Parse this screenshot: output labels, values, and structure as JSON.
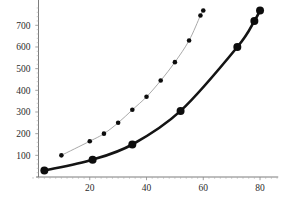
{
  "chart_data": {
    "type": "line",
    "title": "",
    "subtitle": "",
    "xlabel": "",
    "ylabel": "",
    "xlim": [
      0,
      85
    ],
    "ylim": [
      0,
      790
    ],
    "grid": false,
    "legend": "none",
    "x_ticks": [
      20,
      40,
      60,
      80
    ],
    "x_tick_labels": [
      "20",
      "40",
      "60",
      "80"
    ],
    "y_ticks": [
      100,
      200,
      300,
      400,
      500,
      600,
      700
    ],
    "y_tick_labels": [
      "100",
      "200",
      "300",
      "400",
      "500",
      "600",
      "700"
    ],
    "series": [
      {
        "name": "upper-curve",
        "style": "thin-line-small-markers",
        "color": "#9a9a9a",
        "marker_color": "#0d0d0d",
        "points": [
          {
            "x": 10,
            "y": 100
          },
          {
            "x": 20,
            "y": 165
          },
          {
            "x": 25,
            "y": 200
          },
          {
            "x": 30,
            "y": 250
          },
          {
            "x": 35,
            "y": 310
          },
          {
            "x": 40,
            "y": 370
          },
          {
            "x": 45,
            "y": 445
          },
          {
            "x": 50,
            "y": 530
          },
          {
            "x": 55,
            "y": 630
          },
          {
            "x": 59,
            "y": 745
          },
          {
            "x": 60,
            "y": 768
          }
        ]
      },
      {
        "name": "lower-curve",
        "style": "thick-line-large-markers",
        "color": "#141414",
        "marker_color": "#0d0d0d",
        "points": [
          {
            "x": 4,
            "y": 30
          },
          {
            "x": 21,
            "y": 80
          },
          {
            "x": 35,
            "y": 150
          },
          {
            "x": 52,
            "y": 305
          },
          {
            "x": 72,
            "y": 600
          },
          {
            "x": 78,
            "y": 720
          },
          {
            "x": 80,
            "y": 768
          }
        ]
      }
    ]
  },
  "axes": {
    "x_axis_name": "x-axis",
    "y_axis_name": "y-axis"
  }
}
